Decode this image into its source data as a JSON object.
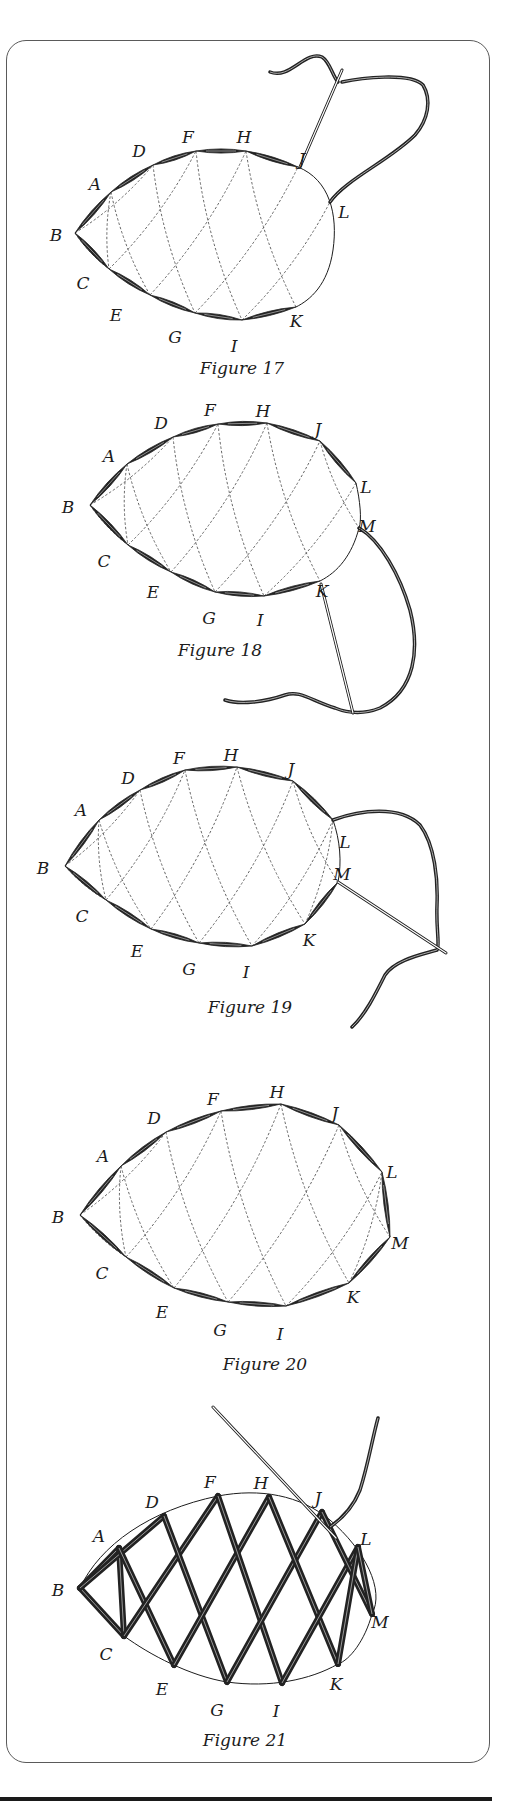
{
  "colors": {
    "ink": "#1c1c1c",
    "thread": "#222222",
    "dash": "#555555",
    "paper": "#ffffff"
  },
  "figures": [
    {
      "caption": "Figure 17",
      "caption_pos": [
        242,
        374
      ],
      "points": {
        "A": [
          111,
          192
        ],
        "B": [
          75,
          233
        ],
        "C": [
          109,
          269
        ],
        "D": [
          153,
          165
        ],
        "E": [
          150,
          295
        ],
        "F": [
          196,
          151
        ],
        "G": [
          195,
          313
        ],
        "H": [
          246,
          151
        ],
        "I": [
          242,
          320
        ],
        "J": [
          298,
          167
        ],
        "K": [
          296,
          307
        ],
        "L": [
          330,
          202
        ]
      },
      "label_offsets": {
        "A": [
          -16,
          -2
        ],
        "B": [
          -19,
          8
        ],
        "C": [
          -26,
          20
        ],
        "D": [
          -14,
          -8
        ],
        "E": [
          -34,
          26
        ],
        "F": [
          -8,
          -8
        ],
        "G": [
          -20,
          30
        ],
        "H": [
          -2,
          -8
        ],
        "I": [
          -8,
          32
        ],
        "J": [
          4,
          -2
        ],
        "K": [
          0,
          20
        ],
        "L": [
          14,
          16
        ]
      },
      "top_chain": [
        "B",
        "A",
        "D",
        "F",
        "H",
        "J"
      ],
      "bottom_chain": [
        "B",
        "C",
        "E",
        "G",
        "I",
        "K"
      ],
      "outline_rest": "M298,167 C330,180 338,215 333,250 C328,285 310,300 296,307",
      "dashes": [
        [
          "B",
          "D"
        ],
        [
          "B",
          "C"
        ],
        [
          "A",
          "E"
        ],
        [
          "D",
          "G"
        ],
        [
          "F",
          "I"
        ],
        [
          "H",
          "K"
        ],
        [
          "C",
          "F"
        ],
        [
          "E",
          "H"
        ],
        [
          "G",
          "J"
        ],
        [
          "I",
          "L"
        ],
        [
          "A",
          "C"
        ]
      ],
      "needle": {
        "from": [
          300,
          167
        ],
        "to": [
          342,
          70
        ]
      },
      "threads": [
        "M342,82 C360,78 410,72 423,85 C432,100 428,120 415,135 C390,160 345,180 330,202",
        "M270,72 C290,80 305,50 322,57 C330,62 332,75 338,82"
      ]
    },
    {
      "caption": "Figure 18",
      "caption_pos": [
        220,
        656
      ],
      "points": {
        "A": [
          127,
          464
        ],
        "B": [
          90,
          505
        ],
        "C": [
          128,
          545
        ],
        "D": [
          173,
          437
        ],
        "E": [
          171,
          572
        ],
        "F": [
          218,
          424
        ],
        "G": [
          215,
          592
        ],
        "H": [
          267,
          423
        ],
        "I": [
          264,
          596
        ],
        "J": [
          320,
          441
        ],
        "K": [
          320,
          581
        ],
        "L": [
          356,
          483
        ],
        "M": [
          359,
          528
        ]
      },
      "label_offsets": {
        "A": [
          -18,
          -2
        ],
        "B": [
          -22,
          8
        ],
        "C": [
          -24,
          22
        ],
        "D": [
          -12,
          -8
        ],
        "E": [
          -18,
          26
        ],
        "F": [
          -8,
          -8
        ],
        "G": [
          -6,
          32
        ],
        "H": [
          -4,
          -6
        ],
        "I": [
          -4,
          30
        ],
        "J": [
          -2,
          -6
        ],
        "K": [
          2,
          16
        ],
        "L": [
          10,
          10
        ],
        "M": [
          8,
          4
        ]
      },
      "top_chain": [
        "B",
        "A",
        "D",
        "F",
        "H",
        "J",
        "L"
      ],
      "bottom_chain": [
        "B",
        "C",
        "E",
        "G",
        "I",
        "K"
      ],
      "outline_rest": "M356,483 C360,500 362,520 359,528 C352,555 338,572 320,581",
      "dashes": [
        [
          "B",
          "D"
        ],
        [
          "B",
          "C"
        ],
        [
          "A",
          "E"
        ],
        [
          "D",
          "G"
        ],
        [
          "F",
          "I"
        ],
        [
          "H",
          "K"
        ],
        [
          "C",
          "F"
        ],
        [
          "E",
          "H"
        ],
        [
          "G",
          "J"
        ],
        [
          "I",
          "L"
        ],
        [
          "A",
          "C"
        ],
        [
          "J",
          "M"
        ]
      ],
      "needle": {
        "from": [
          321,
          584
        ],
        "to": [
          353,
          713
        ]
      },
      "threads": [
        "M359,528 C380,540 400,575 410,610 C420,650 415,690 380,708 C360,716 345,712 335,708 C310,700 300,690 285,695 C265,702 240,705 225,700"
      ]
    },
    {
      "caption": "Figure 19",
      "caption_pos": [
        250,
        1013
      ],
      "points": {
        "A": [
          99,
          820
        ],
        "B": [
          65,
          866
        ],
        "C": [
          106,
          900
        ],
        "D": [
          140,
          790
        ],
        "E": [
          151,
          929
        ],
        "F": [
          185,
          770
        ],
        "G": [
          199,
          943
        ],
        "H": [
          237,
          767
        ],
        "I": [
          252,
          946
        ],
        "J": [
          293,
          781
        ],
        "K": [
          305,
          924
        ],
        "L": [
          333,
          820
        ],
        "M": [
          338,
          882
        ]
      },
      "label_offsets": {
        "A": [
          -18,
          -4
        ],
        "B": [
          -22,
          8
        ],
        "C": [
          -24,
          22
        ],
        "D": [
          -12,
          -6
        ],
        "E": [
          -14,
          28
        ],
        "F": [
          -6,
          -6
        ],
        "G": [
          -10,
          32
        ],
        "H": [
          -6,
          -6
        ],
        "I": [
          -6,
          32
        ],
        "J": [
          -2,
          -6
        ],
        "K": [
          4,
          22
        ],
        "L": [
          12,
          28
        ],
        "M": [
          4,
          -2
        ]
      },
      "top_chain": [
        "B",
        "A",
        "D",
        "F",
        "H",
        "J",
        "L"
      ],
      "bottom_chain": [
        "B",
        "C",
        "E",
        "G",
        "I",
        "K",
        "M"
      ],
      "outline_rest": "M333,820 C340,840 342,862 338,882",
      "dashes": [
        [
          "B",
          "D"
        ],
        [
          "B",
          "C"
        ],
        [
          "A",
          "E"
        ],
        [
          "D",
          "G"
        ],
        [
          "F",
          "I"
        ],
        [
          "H",
          "K"
        ],
        [
          "C",
          "F"
        ],
        [
          "E",
          "H"
        ],
        [
          "G",
          "J"
        ],
        [
          "I",
          "L"
        ],
        [
          "A",
          "C"
        ],
        [
          "J",
          "M"
        ],
        [
          "K",
          "L"
        ]
      ],
      "needle": {
        "from": [
          338,
          882
        ],
        "to": [
          446,
          953
        ]
      },
      "threads": [
        "M333,820 C360,810 400,805 420,825 C435,845 438,880 437,905 C436,930 440,945 437,950 C420,955 395,960 385,975 C375,995 365,1015 352,1027"
      ]
    },
    {
      "caption": "Figure 20",
      "caption_pos": [
        265,
        1370
      ],
      "points": {
        "A": [
          121,
          1166
        ],
        "B": [
          80,
          1215
        ],
        "C": [
          126,
          1257
        ],
        "D": [
          166,
          1132
        ],
        "E": [
          174,
          1288
        ],
        "F": [
          221,
          1111
        ],
        "G": [
          228,
          1302
        ],
        "H": [
          281,
          1104
        ],
        "I": [
          286,
          1306
        ],
        "J": [
          339,
          1125
        ],
        "K": [
          349,
          1283
        ],
        "L": [
          382,
          1172
        ],
        "M": [
          390,
          1237
        ]
      },
      "label_offsets": {
        "A": [
          -18,
          -4
        ],
        "B": [
          -22,
          8
        ],
        "C": [
          -24,
          22
        ],
        "D": [
          -12,
          -8
        ],
        "E": [
          -12,
          30
        ],
        "F": [
          -8,
          -6
        ],
        "G": [
          -8,
          34
        ],
        "H": [
          -4,
          -6
        ],
        "I": [
          -6,
          34
        ],
        "J": [
          -4,
          -6
        ],
        "K": [
          4,
          20
        ],
        "L": [
          10,
          6
        ],
        "M": [
          10,
          12
        ]
      },
      "top_chain": [
        "B",
        "A",
        "D",
        "F",
        "H",
        "J",
        "L",
        "M"
      ],
      "bottom_chain": [
        "B",
        "C",
        "E",
        "G",
        "I",
        "K",
        "M"
      ],
      "outline_rest": "",
      "dashes": [
        [
          "B",
          "D"
        ],
        [
          "B",
          "C"
        ],
        [
          "A",
          "E"
        ],
        [
          "D",
          "G"
        ],
        [
          "F",
          "I"
        ],
        [
          "H",
          "K"
        ],
        [
          "C",
          "F"
        ],
        [
          "E",
          "H"
        ],
        [
          "G",
          "J"
        ],
        [
          "I",
          "L"
        ],
        [
          "A",
          "C"
        ],
        [
          "J",
          "M"
        ],
        [
          "K",
          "L"
        ]
      ],
      "needle": null,
      "threads": []
    },
    {
      "caption": "Figure 21",
      "caption_pos": [
        245,
        1746
      ],
      "points": {
        "A": [
          119,
          1548
        ],
        "B": [
          80,
          1588
        ],
        "C": [
          124,
          1636
        ],
        "D": [
          164,
          1516
        ],
        "E": [
          174,
          1665
        ],
        "F": [
          218,
          1496
        ],
        "G": [
          227,
          1682
        ],
        "H": [
          269,
          1497
        ],
        "I": [
          282,
          1683
        ],
        "J": [
          322,
          1512
        ],
        "K": [
          338,
          1664
        ],
        "L": [
          358,
          1547
        ],
        "M": [
          372,
          1614
        ]
      },
      "label_offsets": {
        "A": [
          -20,
          -6
        ],
        "B": [
          -22,
          8
        ],
        "C": [
          -18,
          24
        ],
        "D": [
          -12,
          -8
        ],
        "E": [
          -12,
          30
        ],
        "F": [
          -8,
          -8
        ],
        "G": [
          -10,
          34
        ],
        "H": [
          -8,
          -8
        ],
        "I": [
          -6,
          34
        ],
        "J": [
          -4,
          -8
        ],
        "K": [
          -2,
          26
        ],
        "L": [
          8,
          -2
        ],
        "M": [
          8,
          14
        ]
      },
      "outline_path": "M80,1588 C100,1545 150,1510 218,1496 C260,1488 300,1495 330,1520 C365,1550 385,1590 372,1614 C365,1640 350,1660 338,1664 C310,1680 270,1688 227,1682 C190,1676 150,1655 124,1636",
      "net": [
        [
          "B",
          "A"
        ],
        [
          "B",
          "C"
        ],
        [
          "A",
          "C"
        ],
        [
          "B",
          "D"
        ],
        [
          "A",
          "E"
        ],
        [
          "C",
          "F"
        ],
        [
          "D",
          "G"
        ],
        [
          "E",
          "H"
        ],
        [
          "F",
          "I"
        ],
        [
          "G",
          "J"
        ],
        [
          "H",
          "K"
        ],
        [
          "I",
          "L"
        ],
        [
          "J",
          "M"
        ],
        [
          "K",
          "L"
        ],
        [
          "L",
          "M"
        ]
      ],
      "needle": {
        "from": [
          213,
          1407
        ],
        "to": [
          336,
          1538
        ]
      },
      "threads": [
        "M330,1527 C340,1520 352,1510 360,1490 C368,1465 372,1440 378,1418"
      ]
    }
  ]
}
